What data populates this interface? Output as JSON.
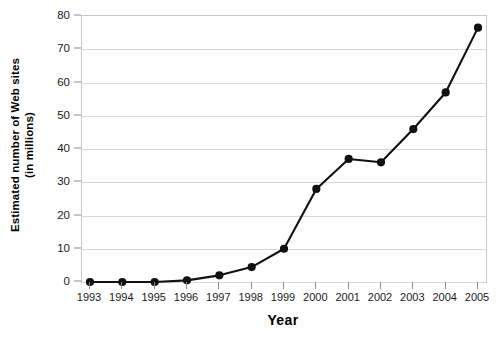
{
  "chart_data": {
    "type": "line",
    "title": "",
    "xlabel": "Year",
    "ylabel": "Estimated number of Web sites (in millions)",
    "ylabel_line1": "Estimated number of Web sites",
    "ylabel_line2": "(in millions)",
    "categories": [
      "1993",
      "1994",
      "1995",
      "1996",
      "1997",
      "1998",
      "1999",
      "2000",
      "2001",
      "2002",
      "2003",
      "2004",
      "2005"
    ],
    "values": [
      0,
      0,
      0,
      0.5,
      2,
      4.5,
      10,
      28,
      37,
      36,
      46,
      57,
      76.5
    ],
    "series": [
      {
        "name": "Estimated number of Web sites",
        "values": [
          0,
          0,
          0,
          0.5,
          2,
          4.5,
          10,
          28,
          37,
          36,
          46,
          57,
          76.5
        ]
      }
    ],
    "yticks": [
      0,
      10,
      20,
      30,
      40,
      50,
      60,
      70,
      80
    ],
    "ytick_labels": [
      "0",
      "10",
      "20",
      "30",
      "40",
      "50",
      "60",
      "70",
      "80"
    ],
    "ylim": [
      0,
      80
    ],
    "xlim": [
      "1993",
      "2005"
    ],
    "grid": true,
    "grid_axis": "y",
    "legend": false,
    "legend_position": "none",
    "line_color": "#111111",
    "marker": "circle",
    "marker_color": "#111111",
    "background_color": "#ffffff",
    "plot_border_color": "#c9c9c9",
    "gridline_color": "#d8d8d8"
  }
}
